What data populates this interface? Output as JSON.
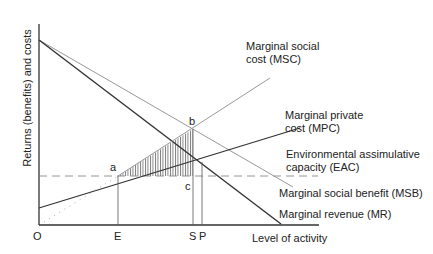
{
  "diagram": {
    "y_axis_label": "Returns (benefits) and costs",
    "x_axis_label": "Level of activity",
    "x_ticks": {
      "origin": "O",
      "e": "E",
      "s": "S",
      "p": "P"
    },
    "points": {
      "a": "a",
      "b": "b",
      "c": "c"
    },
    "curves": {
      "msc": [
        "Marginal social",
        "cost (MSC)"
      ],
      "mpc": [
        "Marginal private",
        "cost (MPC)"
      ],
      "eac": [
        "Environmental assimulative",
        "capacity (EAC)"
      ],
      "msb": "Marginal social benefit (MSB)",
      "mr": "Marginal revenue (MR)"
    },
    "colors": {
      "dark_line": "#333333",
      "light_line": "#999999",
      "hatch": "#555555"
    }
  }
}
